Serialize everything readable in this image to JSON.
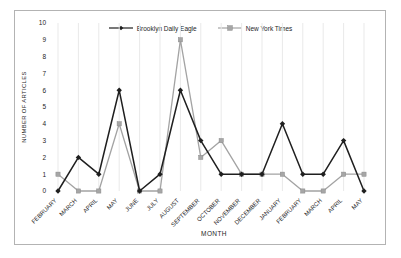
{
  "chart_data": {
    "type": "line",
    "categories": [
      "FEBRUARY",
      "MARCH",
      "APRIL",
      "MAY",
      "JUNE",
      "JULY",
      "AUGUST",
      "SEPTEMBER",
      "OCTOBER",
      "NOVEMBER",
      "DECEMBER",
      "JANUARY",
      "FEBRUARY",
      "MARCH",
      "APRIL",
      "MAY"
    ],
    "series": [
      {
        "name": "Brooklyn Daily Eagle",
        "marker": "diamond",
        "color": "#1f1f1f",
        "marker_fill": "#1f1f1f",
        "values": [
          0,
          2,
          1,
          6,
          0,
          1,
          6,
          3,
          1,
          1,
          1,
          4,
          1,
          1,
          3,
          0
        ]
      },
      {
        "name": "New York Times",
        "marker": "square",
        "color": "#a3a3a3",
        "marker_fill": "#a6a6a6",
        "values": [
          1,
          0,
          0,
          4,
          0,
          0,
          9,
          2,
          3,
          1,
          1,
          1,
          0,
          0,
          1,
          1
        ]
      }
    ],
    "xlabel": "MONTH",
    "ylabel": "NUMBER OF ARTICLES",
    "ylim": [
      0,
      10
    ],
    "ytick_step": 1,
    "legend_position": "top",
    "grid": "vertical-only"
  },
  "style": {
    "background": "#ffffff",
    "frame_border": "#b3b3b3",
    "gridline": "#e9e9e9",
    "text": "#262626",
    "square_marker_edge": "#8a8a8a"
  }
}
